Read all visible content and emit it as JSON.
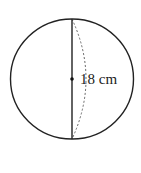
{
  "diagram": {
    "shape": "sphere",
    "diameter_label": "18 cm",
    "colors": {
      "stroke": "#222222",
      "dashed": "#666666",
      "background": "#ffffff"
    }
  }
}
